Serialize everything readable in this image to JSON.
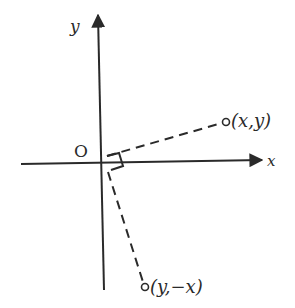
{
  "diagram": {
    "type": "coordinate-rotation",
    "axes": {
      "x_label": "x",
      "y_label": "y",
      "origin_label": "O"
    },
    "points": [
      {
        "id": "p1",
        "label": "(x,y)"
      },
      {
        "id": "p2",
        "label": "(y,−x)"
      }
    ],
    "annotations": {
      "right_angle": "right angle between the two segments from the origin"
    },
    "colors": {
      "ink": "#2a2a2a",
      "background": "#ffffff"
    }
  }
}
